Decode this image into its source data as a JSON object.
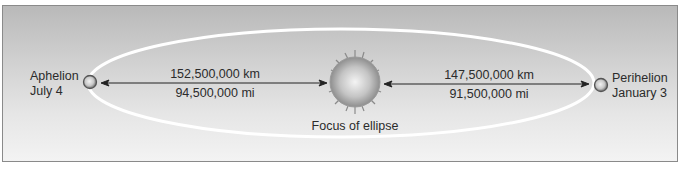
{
  "aphelion": {
    "title": "Aphelion",
    "date": "July 4"
  },
  "perihelion": {
    "title": "Perihelion",
    "date": "January 3"
  },
  "distances": {
    "aphelion_km": "152,500,000 km",
    "aphelion_mi": "94,500,000 mi",
    "perihelion_km": "147,500,000 km",
    "perihelion_mi": "91,500,000 mi"
  },
  "sun_label": "Focus of ellipse",
  "colors": {
    "background_top": "#b9b9b9",
    "background_bottom": "#f3f3f3",
    "orbit": "#ffffff",
    "text": "#2b2b2b"
  }
}
